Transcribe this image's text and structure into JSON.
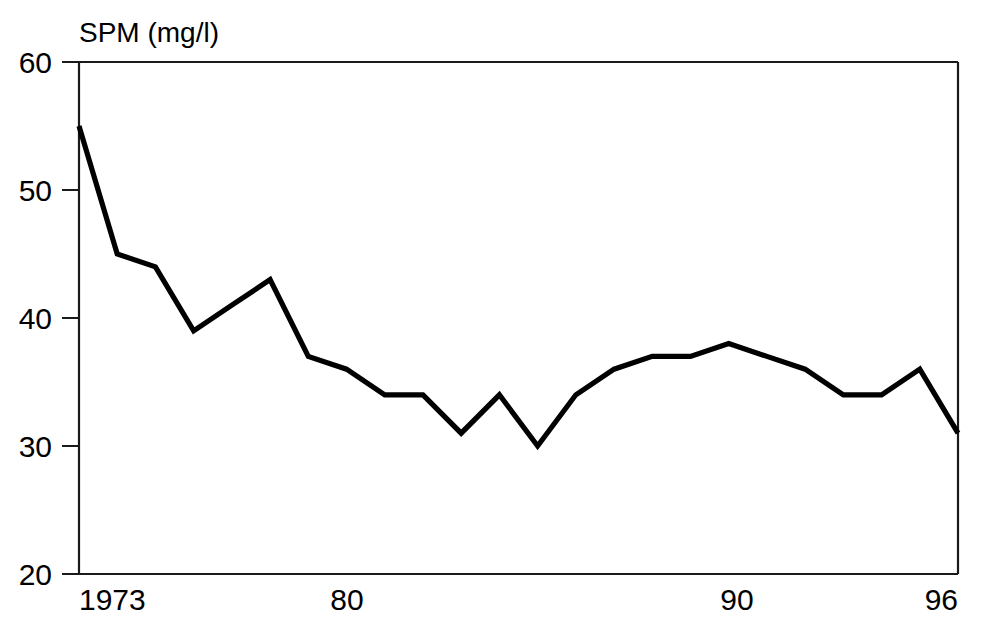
{
  "chart_data": {
    "type": "line",
    "title": "SPM (mg/l)",
    "xlabel": "",
    "ylabel": "SPM (mg/l)",
    "x": [
      1973,
      1974,
      1975,
      1976,
      1977,
      1978,
      1979,
      1980,
      1981,
      1982,
      1983,
      1984,
      1985,
      1986,
      1987,
      1988,
      1989,
      1990,
      1991,
      1992,
      1993,
      1994,
      1995,
      1996
    ],
    "values": [
      55,
      45,
      44,
      39,
      41,
      43,
      37,
      36,
      34,
      34,
      31,
      34,
      30,
      34,
      36,
      37,
      37,
      38,
      37,
      36,
      34,
      34,
      36,
      31
    ],
    "series": [
      {
        "name": "SPM",
        "values": [
          55,
          45,
          44,
          39,
          41,
          43,
          37,
          36,
          34,
          34,
          31,
          34,
          30,
          34,
          36,
          37,
          37,
          38,
          37,
          36,
          34,
          34,
          36,
          31
        ]
      }
    ],
    "xlim": [
      1973,
      1996
    ],
    "ylim": [
      20,
      60
    ],
    "xticks": [
      1973,
      1980,
      1990,
      1996
    ],
    "xtick_labels": [
      "1973",
      "80",
      "90",
      "96"
    ],
    "yticks": [
      20,
      30,
      40,
      50,
      60
    ],
    "ytick_labels": [
      "20",
      "30",
      "40",
      "50",
      "60"
    ],
    "grid": false,
    "legend": false,
    "line_color": "#000000",
    "background_color": "#ffffff"
  },
  "axes": {
    "y_labels": [
      {
        "text": "60",
        "value": 60
      },
      {
        "text": "50",
        "value": 50
      },
      {
        "text": "40",
        "value": 40
      },
      {
        "text": "30",
        "value": 30
      },
      {
        "text": "20",
        "value": 20
      }
    ],
    "x_labels": [
      {
        "text": "1973",
        "value": 1973
      },
      {
        "text": "80",
        "value": 1980
      },
      {
        "text": "90",
        "value": 1990
      },
      {
        "text": "96",
        "value": 1996
      }
    ]
  },
  "title": {
    "text": "SPM (mg/l)"
  }
}
